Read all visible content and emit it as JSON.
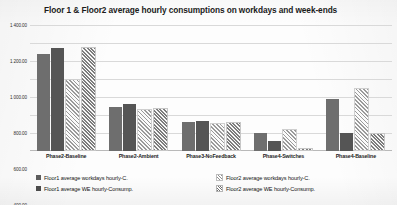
{
  "chart_data": {
    "type": "bar",
    "title": "Floor 1 & Floor2 average hourly consumptions on workdays and week-ends",
    "xlabel": "",
    "ylabel": "",
    "ylim": [
      0,
      1400
    ],
    "grid": true,
    "legend_position": "bottom",
    "yticks": [
      "200.00",
      "400.00",
      "600.00",
      "800.00",
      "1 000.00",
      "1 200.00",
      "1 400.00"
    ],
    "ytick_values": [
      200,
      400,
      600,
      800,
      1000,
      1200,
      1400
    ],
    "categories": [
      "Phase2-Baseline",
      "Phase2-Ambient",
      "Phase3-NoFeedback",
      "Phase4-Switches",
      "Phase4-Baseline"
    ],
    "series": [
      {
        "name": "Floor1 average workdays hourly-C.",
        "fill": "solid-medium-gray",
        "color": "#6e6e6e",
        "values": [
          1075,
          490,
          320,
          200,
          580
        ]
      },
      {
        "name": "Floor1 average WE hourly-Consump.",
        "fill": "solid-dark-gray",
        "color": "#555555",
        "values": [
          1150,
          520,
          330,
          110,
          200
        ]
      },
      {
        "name": "Floor2 average workdays hourly-C.",
        "fill": "hatched-light-diagonal",
        "color": "#9a9a9a",
        "values": [
          780,
          440,
          290,
          220,
          680
        ]
      },
      {
        "name": "Floor2  average WE hourly-Consump.",
        "fill": "hatched-dense-diagonal",
        "color": "#7d7d7d",
        "values": [
          1130,
          460,
          300,
          15,
          175
        ]
      }
    ]
  }
}
